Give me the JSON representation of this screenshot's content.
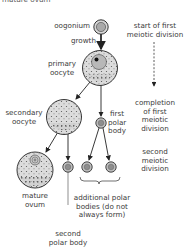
{
  "diagram": {
    "type": "oogenesis flow diagram",
    "cut_off_top_text": "mature ovum",
    "cells": [
      {
        "id": "oogonium",
        "label": "oogonium"
      },
      {
        "id": "primary_oocyte",
        "label_lines": [
          "primary",
          "oocyte"
        ]
      },
      {
        "id": "secondary_oocyte",
        "label_lines": [
          "secondary",
          "oocyte"
        ]
      },
      {
        "id": "first_polar_body",
        "label_lines": [
          "first",
          "polar",
          "body"
        ]
      },
      {
        "id": "mature_ovum",
        "label_lines": [
          "mature",
          "ovum"
        ]
      },
      {
        "id": "second_polar_body",
        "label_lines": [
          "second",
          "polar body"
        ]
      },
      {
        "id": "additional_polar_bodies",
        "label_lines": [
          "additional polar",
          "bodies (do not",
          "always form)"
        ]
      }
    ],
    "arrows": [
      {
        "from": "oogonium",
        "to": "primary_oocyte",
        "label": "growth"
      },
      {
        "from": "primary_oocyte",
        "to": "secondary_oocyte"
      },
      {
        "from": "primary_oocyte",
        "to": "first_polar_body"
      },
      {
        "from": "secondary_oocyte",
        "to": "mature_ovum"
      },
      {
        "from": "secondary_oocyte",
        "to": "second_polar_body"
      },
      {
        "from": "first_polar_body",
        "to": "additional_polar_bodies"
      }
    ],
    "stages": {
      "start": [
        "start of first",
        "meiotic division"
      ],
      "completion": [
        "completion",
        "of first",
        "meiotic",
        "division"
      ],
      "second": [
        "second",
        "meiotic",
        "division"
      ]
    },
    "colors": {
      "cell_fill": "#d9d9d9",
      "nucleus_fill": "#b5b5b5",
      "stroke": "#2a2a2a",
      "text": "#3a3a3a"
    }
  }
}
